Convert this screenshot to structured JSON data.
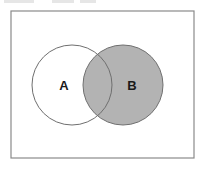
{
  "figure": {
    "type": "venn-diagram",
    "caption": "",
    "width": 205,
    "height": 170,
    "background_color": "#ffffff"
  },
  "universal_set": {
    "shape": "rectangle",
    "x": 11,
    "y": 11,
    "width": 183,
    "height": 147,
    "fill": "#ffffff",
    "stroke": "#8a8a8a",
    "stroke_width": 1.2,
    "label": ""
  },
  "sets": [
    {
      "id": "A",
      "label": "A",
      "shaded": false,
      "cx": 72,
      "cy": 85,
      "r": 40,
      "fill": "#ffffff",
      "stroke": "#6f6f6f",
      "stroke_width": 1,
      "label_x": 64,
      "label_y": 85
    },
    {
      "id": "B",
      "label": "B",
      "shaded": true,
      "cx": 123,
      "cy": 85,
      "r": 40,
      "fill": "#b3b3b3",
      "stroke": "#6f6f6f",
      "stroke_width": 1,
      "label_x": 132,
      "label_y": 85
    }
  ],
  "regions": {
    "a_only": {
      "name": "A only",
      "shaded": false,
      "fill": "#ffffff"
    },
    "intersection": {
      "name": "A and B",
      "shaded": true,
      "fill": "#b3b3b3"
    },
    "b_only": {
      "name": "B only",
      "shaded": true,
      "fill": "#b3b3b3"
    },
    "outside": {
      "name": "outside A and B",
      "shaded": false,
      "fill": "#ffffff"
    }
  },
  "shaded_description": "Set B is shaded in full, including the region it shares with set A.",
  "artifacts": {
    "top_crop_smudges": [
      {
        "left": 4,
        "width": 30
      },
      {
        "left": 52,
        "width": 22
      },
      {
        "left": 80,
        "width": 16
      }
    ]
  }
}
